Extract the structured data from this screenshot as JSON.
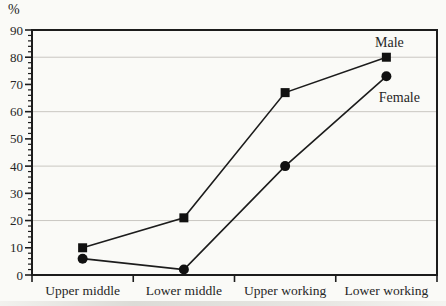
{
  "figure": {
    "background": "#fafaf7",
    "scan_artifact": "faint gray smear along bottom edge"
  },
  "chart_data": {
    "type": "line",
    "title": "",
    "xlabel": "",
    "ylabel": "%",
    "categories": [
      "Upper middle",
      "Lower middle",
      "Upper working",
      "Lower working"
    ],
    "series": [
      {
        "name": "Male",
        "marker": "square",
        "values": [
          10,
          21,
          67,
          80
        ],
        "label_dx": 3,
        "label_dy": -10
      },
      {
        "name": "Female",
        "marker": "circle",
        "values": [
          6,
          2,
          40,
          73
        ],
        "label_dx": 13,
        "label_dy": 26
      }
    ],
    "ylim": [
      0,
      90
    ],
    "ytick_step": 10,
    "ytick_minor_step": 2,
    "gridline_values": [
      20,
      40,
      60,
      80
    ],
    "grid": "horizontal only, at 20/40/60/80",
    "legend_position": "inline labels next to last data points",
    "colors": {
      "line": "#1c1c1c",
      "marker": "#111111",
      "grid": "#c9c7c2",
      "text": "#262626",
      "background": "#fafaf7"
    }
  }
}
